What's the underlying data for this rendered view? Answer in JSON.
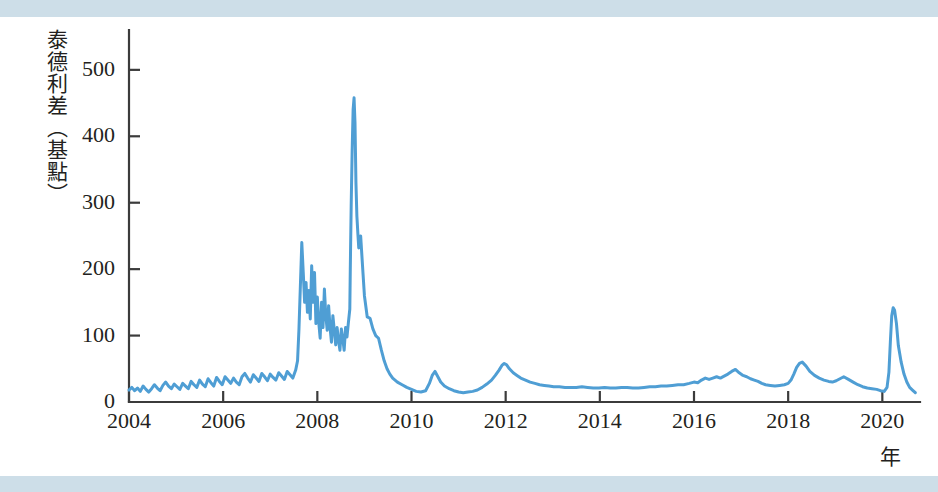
{
  "figure": {
    "background_color": "#ffffff",
    "band_color": "#c4d8e4",
    "axis_color": "#3b3b3b",
    "series_color": "#4f9ed4"
  },
  "axis": {
    "y_title": "泰德利差（基點）",
    "x_unit_label": "年",
    "y_ticks": [
      "0",
      "100",
      "200",
      "300",
      "400",
      "500"
    ],
    "x_ticks": [
      "2004",
      "2006",
      "2008",
      "2010",
      "2012",
      "2014",
      "2016",
      "2018",
      "2020"
    ]
  },
  "chart_data": {
    "type": "line",
    "title": "",
    "subtitle": "",
    "xlabel": "年",
    "ylabel": "泰德利差（基點）",
    "xlim": [
      2004.0,
      2020.8
    ],
    "ylim": [
      0,
      560
    ],
    "ytick_values": [
      0,
      100,
      200,
      300,
      400,
      500
    ],
    "xtick_values": [
      2004,
      2006,
      2008,
      2010,
      2012,
      2014,
      2016,
      2018,
      2020
    ],
    "grid": false,
    "legend": "none",
    "series": [
      {
        "name": "TED spread (basis points)",
        "color": "#4f9ed4",
        "x": [
          2004.0,
          2004.06,
          2004.12,
          2004.18,
          2004.24,
          2004.3,
          2004.36,
          2004.42,
          2004.48,
          2004.54,
          2004.6,
          2004.66,
          2004.72,
          2004.78,
          2004.84,
          2004.9,
          2004.96,
          2005.02,
          2005.08,
          2005.14,
          2005.2,
          2005.26,
          2005.32,
          2005.38,
          2005.44,
          2005.5,
          2005.56,
          2005.62,
          2005.68,
          2005.74,
          2005.8,
          2005.86,
          2005.92,
          2005.98,
          2006.04,
          2006.1,
          2006.16,
          2006.22,
          2006.28,
          2006.34,
          2006.4,
          2006.46,
          2006.52,
          2006.58,
          2006.64,
          2006.7,
          2006.76,
          2006.82,
          2006.88,
          2006.94,
          2007.0,
          2007.06,
          2007.12,
          2007.18,
          2007.24,
          2007.3,
          2007.36,
          2007.42,
          2007.48,
          2007.54,
          2007.58,
          2007.61,
          2007.64,
          2007.67,
          2007.7,
          2007.73,
          2007.76,
          2007.79,
          2007.82,
          2007.85,
          2007.88,
          2007.91,
          2007.94,
          2007.97,
          2008.0,
          2008.03,
          2008.06,
          2008.09,
          2008.12,
          2008.15,
          2008.18,
          2008.21,
          2008.24,
          2008.27,
          2008.3,
          2008.33,
          2008.36,
          2008.39,
          2008.42,
          2008.45,
          2008.48,
          2008.51,
          2008.54,
          2008.57,
          2008.6,
          2008.63,
          2008.66,
          2008.69,
          2008.7,
          2008.72,
          2008.74,
          2008.76,
          2008.78,
          2008.8,
          2008.82,
          2008.84,
          2008.86,
          2008.88,
          2008.92,
          2008.96,
          2009.0,
          2009.06,
          2009.12,
          2009.18,
          2009.24,
          2009.3,
          2009.36,
          2009.42,
          2009.48,
          2009.54,
          2009.6,
          2009.7,
          2009.8,
          2009.9,
          2010.0,
          2010.1,
          2010.2,
          2010.3,
          2010.38,
          2010.44,
          2010.5,
          2010.56,
          2010.62,
          2010.7,
          2010.8,
          2010.9,
          2011.0,
          2011.1,
          2011.2,
          2011.3,
          2011.4,
          2011.5,
          2011.6,
          2011.7,
          2011.78,
          2011.86,
          2011.92,
          2011.97,
          2012.02,
          2012.08,
          2012.16,
          2012.24,
          2012.32,
          2012.42,
          2012.52,
          2012.62,
          2012.72,
          2012.82,
          2012.92,
          2013.02,
          2013.14,
          2013.26,
          2013.38,
          2013.5,
          2013.62,
          2013.74,
          2013.86,
          2013.98,
          2014.1,
          2014.22,
          2014.34,
          2014.46,
          2014.58,
          2014.7,
          2014.82,
          2014.94,
          2015.06,
          2015.18,
          2015.3,
          2015.42,
          2015.54,
          2015.66,
          2015.78,
          2015.9,
          2016.0,
          2016.08,
          2016.16,
          2016.24,
          2016.32,
          2016.4,
          2016.48,
          2016.56,
          2016.64,
          2016.72,
          2016.8,
          2016.88,
          2016.96,
          2017.04,
          2017.12,
          2017.2,
          2017.28,
          2017.36,
          2017.44,
          2017.52,
          2017.62,
          2017.72,
          2017.82,
          2017.92,
          2018.0,
          2018.06,
          2018.12,
          2018.18,
          2018.24,
          2018.3,
          2018.38,
          2018.46,
          2018.56,
          2018.66,
          2018.76,
          2018.86,
          2018.94,
          2019.02,
          2019.1,
          2019.18,
          2019.28,
          2019.38,
          2019.48,
          2019.58,
          2019.68,
          2019.78,
          2019.88,
          2019.96,
          2020.04,
          2020.1,
          2020.14,
          2020.17,
          2020.2,
          2020.23,
          2020.26,
          2020.3,
          2020.34,
          2020.4,
          2020.46,
          2020.52,
          2020.58,
          2020.64,
          2020.7
        ],
        "y": [
          18,
          22,
          17,
          21,
          16,
          24,
          19,
          15,
          20,
          26,
          21,
          17,
          25,
          30,
          24,
          20,
          27,
          23,
          19,
          28,
          24,
          20,
          31,
          26,
          22,
          33,
          27,
          23,
          35,
          29,
          24,
          37,
          31,
          26,
          38,
          33,
          28,
          36,
          30,
          26,
          38,
          43,
          36,
          30,
          41,
          36,
          31,
          43,
          38,
          32,
          42,
          37,
          33,
          44,
          39,
          34,
          46,
          41,
          36,
          48,
          62,
          110,
          175,
          240,
          196,
          150,
          180,
          135,
          168,
          125,
          205,
          150,
          195,
          118,
          158,
          120,
          96,
          150,
          112,
          170,
          130,
          108,
          145,
          112,
          90,
          130,
          108,
          86,
          112,
          92,
          78,
          110,
          95,
          78,
          112,
          98,
          120,
          140,
          200,
          300,
          380,
          440,
          458,
          420,
          330,
          280,
          255,
          232,
          250,
          205,
          160,
          128,
          126,
          110,
          100,
          96,
          78,
          62,
          50,
          42,
          36,
          30,
          26,
          22,
          19,
          16,
          15,
          17,
          28,
          40,
          46,
          38,
          30,
          24,
          20,
          17,
          15,
          14,
          15,
          16,
          18,
          22,
          27,
          33,
          40,
          48,
          55,
          58,
          56,
          50,
          44,
          40,
          36,
          33,
          30,
          28,
          26,
          25,
          24,
          23,
          23,
          22,
          22,
          22,
          23,
          22,
          21,
          21,
          22,
          21,
          21,
          22,
          22,
          21,
          21,
          22,
          23,
          23,
          24,
          24,
          25,
          26,
          26,
          28,
          30,
          29,
          33,
          36,
          34,
          36,
          38,
          36,
          39,
          42,
          46,
          49,
          44,
          40,
          38,
          35,
          33,
          31,
          28,
          26,
          25,
          24,
          25,
          26,
          28,
          33,
          42,
          52,
          58,
          60,
          54,
          46,
          40,
          36,
          33,
          31,
          30,
          32,
          35,
          38,
          34,
          30,
          26,
          23,
          21,
          20,
          19,
          17,
          16,
          22,
          45,
          90,
          130,
          142,
          138,
          118,
          85,
          60,
          42,
          30,
          22,
          18,
          14
        ]
      }
    ],
    "annotations": [
      {
        "label": "2007 subprime onset spikes",
        "approx_x": 2007.6,
        "approx_y": 240
      },
      {
        "label": "2008 Lehman peak",
        "approx_x": 2008.74,
        "approx_y": 458
      },
      {
        "label": "2011 euro crisis bump",
        "approx_x": 2011.92,
        "approx_y": 58
      },
      {
        "label": "2020 COVID spike",
        "approx_x": 2020.17,
        "approx_y": 142
      }
    ]
  }
}
